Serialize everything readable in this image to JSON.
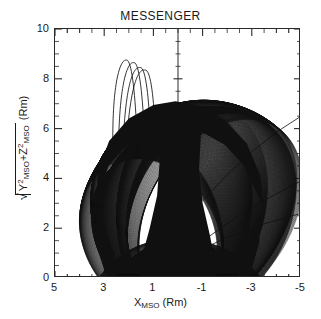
{
  "title": "MESSENGER",
  "axes": {
    "x": {
      "label_main": "X",
      "label_sub": "MSO",
      "label_unit": " (Rm)",
      "ticks": [
        "5",
        "3",
        "1",
        "-1",
        "-3",
        "-5"
      ],
      "tick_values": [
        5,
        3,
        1,
        -1,
        -3,
        -5
      ],
      "range": [
        5,
        -5
      ],
      "minor_per_major": 4
    },
    "y": {
      "label_prefix": "Y",
      "label_sup1": "2",
      "label_sub1": "MSO",
      "label_plus": "+Z",
      "label_sup2": "2",
      "label_sub2": "MSO",
      "label_unit": " (Rm)",
      "ticks": [
        "10",
        "8",
        "6",
        "4",
        "2",
        "0"
      ],
      "tick_values": [
        10,
        8,
        6,
        4,
        2,
        0
      ],
      "range": [
        0,
        10
      ],
      "minor_per_major": 4
    }
  },
  "colors": {
    "frame": "#2a2a2a",
    "trace": "#101010",
    "background": "#ffffff",
    "text": "#1a1a1a"
  },
  "chart_data": {
    "type": "line",
    "title": "MESSENGER",
    "xlabel": "X_MSO (Rm)",
    "ylabel": "sqrt(Y^2_MSO + Z^2_MSO) (Rm)",
    "xlim": [
      5,
      -5
    ],
    "ylim": [
      0,
      10
    ],
    "grid": false,
    "legend": null,
    "n_orbits": 260,
    "planet": {
      "name": "Mercury",
      "center_x": 0,
      "center_y": 0,
      "radius": 1
    },
    "envelope": {
      "peak_y": 7.1,
      "peak_x": 0.1,
      "left_foot_x": 2.35,
      "right_foot_x": -2.35,
      "left_max_x": 3.55,
      "right_max_x": -3.6,
      "waist_half_width": 0.75,
      "notch_depth_y": 2.6
    },
    "orbit_family": {
      "periapsis_altitude_min": 0.08,
      "periapsis_altitude_max": 0.45,
      "apoapsis_r_min": 5.2,
      "apoapsis_r_max": 7.2,
      "inclination_deg": 82,
      "arg_periapsis_start_deg": 118,
      "arg_periapsis_end_deg": 62
    },
    "outlier_traces": [
      {
        "name": "high-apoapsis-loop-1",
        "apex_x": 2.1,
        "apex_y": 8.8
      },
      {
        "name": "high-apoapsis-loop-2",
        "apex_x": 1.8,
        "apex_y": 8.7
      },
      {
        "name": "high-apoapsis-loop-3",
        "apex_x": 1.55,
        "apex_y": 8.5
      },
      {
        "name": "high-apoapsis-loop-4",
        "apex_x": 1.35,
        "apex_y": 8.4
      },
      {
        "name": "escape-arc-upper-right",
        "start_x": -1.0,
        "start_y": 3.1,
        "end_x": -5.0,
        "end_y": 6.5
      },
      {
        "name": "escape-arc-mid-right",
        "start_x": 0.9,
        "start_y": 0.0,
        "end_x": -5.0,
        "end_y": 3.9
      },
      {
        "name": "escape-arc-lower-right",
        "start_x": 1.25,
        "start_y": 0.0,
        "end_x": -5.0,
        "end_y": 2.6
      }
    ],
    "series": [
      {
        "name": "orbit-envelope-outer",
        "values": []
      },
      {
        "name": "orbit-envelope-inner-notch",
        "values": []
      }
    ]
  }
}
